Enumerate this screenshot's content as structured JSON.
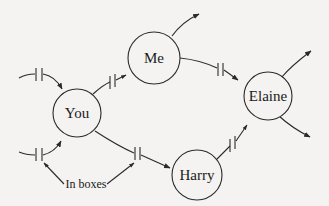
{
  "diagram": {
    "type": "message-passing network",
    "nodes": [
      {
        "id": "you",
        "label": "You"
      },
      {
        "id": "me",
        "label": "Me"
      },
      {
        "id": "elaine",
        "label": "Elaine"
      },
      {
        "id": "harry",
        "label": "Harry"
      }
    ],
    "edges": [
      {
        "from": "external",
        "to": "you",
        "has_inbox": true
      },
      {
        "from": "external",
        "to": "you",
        "has_inbox": true
      },
      {
        "from": "you",
        "to": "me",
        "has_inbox": true
      },
      {
        "from": "you",
        "to": "harry",
        "has_inbox": true
      },
      {
        "from": "me",
        "to": "elaine",
        "has_inbox": true
      },
      {
        "from": "harry",
        "to": "elaine",
        "has_inbox": true
      },
      {
        "from": "me",
        "to": "external",
        "has_inbox": false
      },
      {
        "from": "elaine",
        "to": "external",
        "has_inbox": false
      },
      {
        "from": "elaine",
        "to": "external",
        "has_inbox": false
      }
    ],
    "annotation": {
      "label": "In boxes"
    }
  },
  "colors": {
    "background": "#f4f3f1",
    "stroke": "#2a2a2a",
    "text": "#1a1a1a"
  }
}
